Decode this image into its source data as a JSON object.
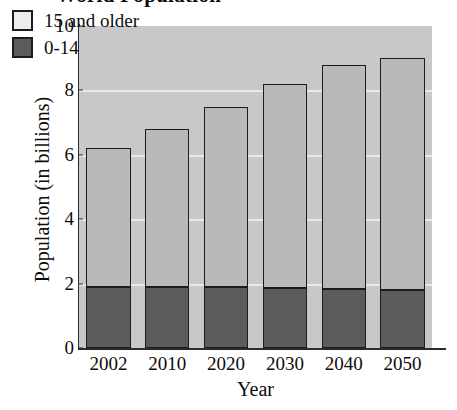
{
  "chart_data": {
    "type": "bar",
    "subtype": "stacked-vertical",
    "title": "World Population",
    "xlabel": "Year",
    "ylabel": "Population (in billions)",
    "categories": [
      "2002",
      "2010",
      "2020",
      "2030",
      "2040",
      "2050"
    ],
    "series": [
      {
        "name": "0-14",
        "values": [
          1.9,
          1.9,
          1.88,
          1.85,
          1.82,
          1.8
        ],
        "color": "#5c5c5c"
      },
      {
        "name": "15 and older",
        "values": [
          4.3,
          4.9,
          5.62,
          6.35,
          7.0,
          7.2
        ],
        "color": "#b9b9b9"
      }
    ],
    "totals": [
      6.2,
      6.8,
      7.5,
      8.2,
      8.8,
      9.0
    ],
    "ylim": [
      0,
      10
    ],
    "yticks": [
      0,
      2,
      4,
      6,
      8,
      10
    ],
    "ytick_labels": [
      "0",
      "2",
      "4",
      "6",
      "8",
      "10"
    ],
    "grid": true,
    "gridlines_at": [
      2,
      4,
      6,
      8
    ],
    "legend_position": "top-left",
    "plot_background": "#c8c8c8",
    "gridline_color": "#eeeeee",
    "axis_color": "#2b2b2b"
  },
  "legend": {
    "entries": [
      {
        "label": "15 and older",
        "swatch": "light"
      },
      {
        "label": "0-14",
        "swatch": "dark"
      }
    ]
  }
}
